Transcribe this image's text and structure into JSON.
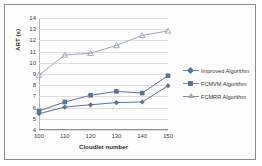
{
  "chart_data": {
    "type": "line",
    "title": "",
    "xlabel": "Cloudlet number",
    "ylabel": "ART (s)",
    "categories": [
      100,
      110,
      120,
      130,
      140,
      150
    ],
    "x": [
      100,
      110,
      120,
      130,
      140,
      150
    ],
    "xlim": [
      100,
      150
    ],
    "ylim": [
      4,
      14
    ],
    "yticks": [
      4,
      5,
      6,
      7,
      8,
      9,
      10,
      11,
      12,
      13,
      14
    ],
    "xticks": [
      100,
      110,
      120,
      130,
      140,
      150
    ],
    "grid": true,
    "legend_position": "right",
    "series": [
      {
        "name": "Improved Algorithm",
        "marker": "diamond",
        "color": "#5b7291",
        "values": [
          5.45,
          6.05,
          6.25,
          6.45,
          6.5,
          7.95
        ]
      },
      {
        "name": "FCMVM Algorithm",
        "marker": "square",
        "color": "#5b7291",
        "values": [
          5.7,
          6.5,
          7.1,
          7.45,
          7.3,
          8.85
        ]
      },
      {
        "name": "FCMRR Algorithm",
        "marker": "triangle",
        "color": "#9aa9bd",
        "values": [
          8.9,
          10.7,
          10.85,
          11.55,
          12.45,
          12.85
        ]
      }
    ]
  },
  "axis": {
    "ylabel": "ART (s)",
    "xlabel": "Cloudlet number"
  },
  "legend": {
    "items": [
      {
        "label": "Improved Algorithm"
      },
      {
        "label": "FCMVM Algorithm"
      },
      {
        "label": "FCMRR Algorithm"
      }
    ]
  }
}
